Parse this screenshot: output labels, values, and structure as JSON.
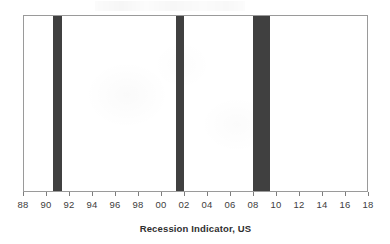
{
  "chart_data": {
    "type": "bar",
    "title": "",
    "subtitle": "",
    "xlabel": "Recession Indicator, US",
    "ylabel": "",
    "xlim": [
      1988,
      2018
    ],
    "ylim": [
      0,
      1
    ],
    "grid": false,
    "legend": null,
    "x_tick_labels": [
      "88",
      "90",
      "92",
      "94",
      "96",
      "98",
      "00",
      "02",
      "04",
      "06",
      "08",
      "10",
      "12",
      "14",
      "16",
      "18"
    ],
    "x_tick_values": [
      1988,
      1990,
      1992,
      1994,
      1996,
      1998,
      2000,
      2002,
      2004,
      2006,
      2008,
      2010,
      2012,
      2014,
      2016,
      2018
    ],
    "x_tick_step": 2,
    "series": [
      {
        "name": "Recession Indicator, US",
        "color": "#404040",
        "values": [
          {
            "start": 1990.55,
            "end": 1991.3,
            "value": 1
          },
          {
            "start": 2001.2,
            "end": 2001.9,
            "value": 1
          },
          {
            "start": 2007.9,
            "end": 2009.4,
            "value": 1
          }
        ]
      }
    ],
    "bands": [
      {
        "label": "1990-1991 recession",
        "start": 1990.55,
        "end": 1991.3
      },
      {
        "label": "2001 recession",
        "start": 2001.2,
        "end": 2001.9
      },
      {
        "label": "2007-2009 recession",
        "start": 2007.9,
        "end": 2009.4
      }
    ]
  },
  "style": {
    "band_color": "#404040",
    "frame_color": "#9a9a9a",
    "tick_color": "#7d7d7d",
    "label_color": "#3d3d3d",
    "title_color": "#2f2f2f",
    "plot_background": "#ffffff",
    "page_background": "#ffffff"
  }
}
